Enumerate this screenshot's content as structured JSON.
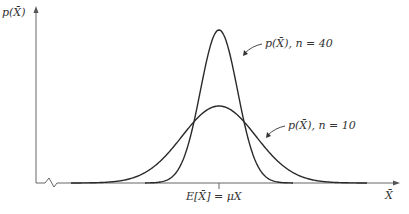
{
  "figure": {
    "y_axis_label": "p(X̄)",
    "x_axis_label": "X̄",
    "center_label": "E[X̄] = μX",
    "curves": [
      {
        "id": "n40",
        "label": "p(X̄), n = 40",
        "n": 40,
        "sigma_px": 18.5,
        "peak_y_px": 30
      },
      {
        "id": "n10",
        "label": "p(X̄), n = 10",
        "n": 10,
        "sigma_px": 37,
        "peak_y_px": 106
      }
    ],
    "colors": {
      "axis": "#666666",
      "curve": "#2a2a2a",
      "text": "#333333"
    }
  },
  "chart_data": {
    "type": "line",
    "title": "",
    "xlabel": "X̄",
    "ylabel": "p(X̄)",
    "annotations": [
      "E[X̄] = μX",
      "p(X̄), n = 40",
      "p(X̄), n = 10"
    ],
    "series": [
      {
        "name": "p(X̄), n = 40",
        "shape": "normal",
        "mean": "μX",
        "relative_height": 1.0,
        "relative_sd": 0.5
      },
      {
        "name": "p(X̄), n = 10",
        "shape": "normal",
        "mean": "μX",
        "relative_height": 0.5,
        "relative_sd": 1.0
      }
    ],
    "grid": false,
    "legend": "inline labels with arrows"
  }
}
